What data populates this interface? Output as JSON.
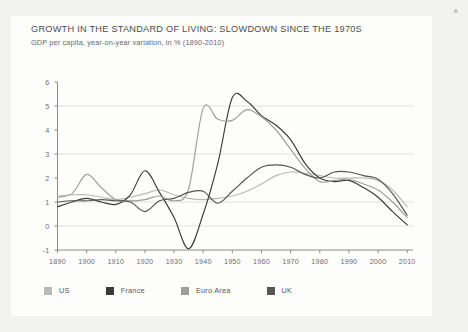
{
  "page": {
    "corner_mark": "A",
    "background_color": "#f2f2f1",
    "card_color": "#fdfdfc"
  },
  "chart_data": {
    "type": "line",
    "title": "GROWTH IN THE STANDARD OF LIVING: SLOWDOWN SINCE THE 1970S",
    "subtitle": "GDP per capita, year-on-year variation, in % (1890-2010)",
    "xlabel": "",
    "ylabel": "",
    "xlim": [
      1890,
      2012
    ],
    "ylim": [
      -1,
      6
    ],
    "grid": "horizontal",
    "gridlines": [
      0,
      1,
      3,
      5
    ],
    "axis_color": "#8a8a8a",
    "grid_color": "#d8d8d6",
    "legend_position": "bottom",
    "xticks": [
      1890,
      1900,
      1910,
      1920,
      1930,
      1940,
      1950,
      1960,
      1970,
      1980,
      1990,
      2000,
      2010
    ],
    "yticks": [
      -1,
      0,
      1,
      2,
      3,
      4,
      5,
      6
    ],
    "x": [
      1890,
      1895,
      1900,
      1905,
      1910,
      1915,
      1920,
      1925,
      1930,
      1935,
      1940,
      1945,
      1950,
      1955,
      1960,
      1965,
      1970,
      1975,
      1980,
      1985,
      1990,
      1995,
      2000,
      2005,
      2010
    ],
    "series": [
      {
        "name": "US",
        "color": "#b9b9b7",
        "values": [
          1.25,
          1.3,
          1.3,
          1.2,
          1.1,
          1.2,
          1.35,
          1.5,
          1.3,
          1.15,
          1.1,
          1.15,
          1.25,
          1.45,
          1.75,
          2.1,
          2.25,
          2.2,
          2.1,
          2.0,
          2.0,
          2.0,
          1.9,
          1.5,
          0.8
        ]
      },
      {
        "name": "France",
        "color": "#3a3a3a",
        "values": [
          0.8,
          1.0,
          1.15,
          1.0,
          0.9,
          1.3,
          2.3,
          1.4,
          0.35,
          -0.95,
          0.5,
          2.6,
          5.35,
          5.2,
          4.6,
          4.2,
          3.6,
          2.6,
          2.0,
          1.85,
          1.9,
          1.6,
          1.2,
          0.6,
          0.05
        ]
      },
      {
        "name": "Euro Area",
        "color": "#9d9d9b",
        "values": [
          1.2,
          1.35,
          2.15,
          1.6,
          1.1,
          1.05,
          1.1,
          1.25,
          1.05,
          1.55,
          4.9,
          4.45,
          4.4,
          4.85,
          4.55,
          4.0,
          3.2,
          2.4,
          1.85,
          1.9,
          1.95,
          1.75,
          1.5,
          1.0,
          0.35
        ]
      },
      {
        "name": "UK",
        "color": "#555553",
        "values": [
          1.0,
          1.05,
          1.05,
          1.1,
          1.05,
          1.0,
          0.6,
          1.05,
          1.15,
          1.4,
          1.45,
          0.95,
          1.45,
          2.0,
          2.45,
          2.55,
          2.45,
          2.15,
          2.0,
          2.25,
          2.25,
          2.1,
          1.95,
          1.35,
          0.45
        ]
      }
    ]
  }
}
